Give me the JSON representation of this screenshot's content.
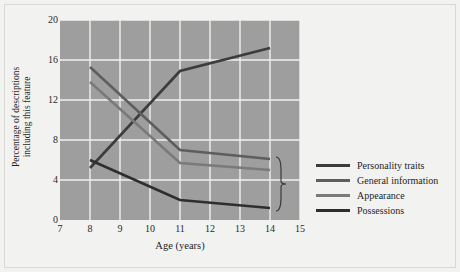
{
  "chart_data": {
    "type": "line",
    "title": "",
    "xlabel": "Age (years)",
    "ylabel": "Percentage of descriptions including this feature",
    "ylabel_line1": "Percentage of descriptions",
    "ylabel_line2": "including this feature",
    "xlim": [
      7,
      15
    ],
    "ylim": [
      0,
      20
    ],
    "xticks": [
      7,
      8,
      9,
      10,
      11,
      12,
      13,
      14,
      15
    ],
    "yticks": [
      0,
      4,
      8,
      12,
      16,
      20
    ],
    "grid": true,
    "legend_position": "right",
    "plot_bg": "#9e9e9e",
    "grid_color": "#f0f0ee",
    "x": [
      8,
      11,
      14
    ],
    "series": [
      {
        "name": "Personality traits",
        "color": "#3c3c3c",
        "values": [
          5.2,
          14.9,
          17.2
        ]
      },
      {
        "name": "General information",
        "color": "#5e5e5e",
        "values": [
          15.3,
          7.0,
          6.1
        ]
      },
      {
        "name": "Appearance",
        "color": "#7a7a7a",
        "values": [
          13.8,
          5.7,
          5.0
        ]
      },
      {
        "name": "Possessions",
        "color": "#2e2e2e",
        "values": [
          6.0,
          2.0,
          1.2
        ]
      }
    ],
    "annotations": [
      {
        "type": "brace",
        "at_x": 14,
        "y_from": 6.3,
        "y_to": 0.9
      }
    ]
  },
  "legend": {
    "items": [
      {
        "label": "Personality traits",
        "color": "#3c3c3c"
      },
      {
        "label": "General information",
        "color": "#5e5e5e"
      },
      {
        "label": "Appearance",
        "color": "#7a7a7a"
      },
      {
        "label": "Possessions",
        "color": "#2e2e2e"
      }
    ]
  },
  "axes": {
    "x_title": "Age (years)",
    "y_title_line1": "Percentage of descriptions",
    "y_title_line2": "including this feature",
    "x_tick_labels": [
      "7",
      "8",
      "9",
      "10",
      "11",
      "12",
      "13",
      "14",
      "15"
    ],
    "y_tick_labels": [
      "0",
      "4",
      "8",
      "12",
      "16",
      "20"
    ]
  }
}
